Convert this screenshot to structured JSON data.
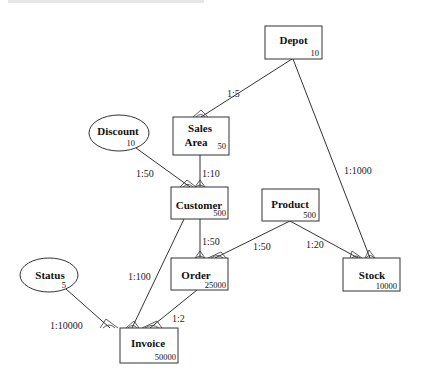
{
  "diagram": {
    "type": "entity-relationship",
    "entities": [
      {
        "id": "depot",
        "name": "Depot",
        "count": "10",
        "shape": "rect",
        "x": 265,
        "y": 26,
        "w": 57,
        "h": 33
      },
      {
        "id": "sales_area",
        "name_lines": [
          "Sales",
          "Area"
        ],
        "count": "50",
        "shape": "rect",
        "x": 173,
        "y": 117,
        "w": 56,
        "h": 38
      },
      {
        "id": "discount",
        "name": "Discount",
        "count": "10",
        "shape": "ellipse",
        "cx": 119,
        "cy": 133,
        "rx": 30,
        "ry": 18
      },
      {
        "id": "customer",
        "name": "Customer",
        "count": "500",
        "shape": "rect",
        "x": 171,
        "y": 187,
        "w": 57,
        "h": 32
      },
      {
        "id": "product",
        "name": "Product",
        "count": "500",
        "shape": "rect",
        "x": 262,
        "y": 189,
        "w": 57,
        "h": 32
      },
      {
        "id": "order",
        "name": "Order",
        "count": "25000",
        "shape": "rect",
        "x": 171,
        "y": 258,
        "w": 57,
        "h": 32
      },
      {
        "id": "stock",
        "name": "Stock",
        "count": "10000",
        "shape": "rect",
        "x": 343,
        "y": 258,
        "w": 57,
        "h": 33
      },
      {
        "id": "status",
        "name": "Status",
        "count": "5",
        "shape": "ellipse",
        "cx": 49,
        "cy": 275,
        "rx": 29,
        "ry": 17
      },
      {
        "id": "invoice",
        "name": "Invoice",
        "count": "50000",
        "shape": "rect",
        "x": 120,
        "y": 328,
        "w": 58,
        "h": 35
      }
    ],
    "relationships": [
      {
        "from": "depot",
        "to": "sales_area",
        "label": "1:5"
      },
      {
        "from": "depot",
        "to": "stock",
        "label": "1:1000"
      },
      {
        "from": "discount",
        "to": "customer",
        "label": "1:50"
      },
      {
        "from": "sales_area",
        "to": "customer",
        "label": "1:10"
      },
      {
        "from": "customer",
        "to": "order",
        "label": "1:50"
      },
      {
        "from": "product",
        "to": "order",
        "label": "1:50"
      },
      {
        "from": "product",
        "to": "stock",
        "label": "1:20"
      },
      {
        "from": "customer",
        "to": "invoice",
        "label": "1:100"
      },
      {
        "from": "status",
        "to": "invoice",
        "label": "1:10000"
      },
      {
        "from": "order",
        "to": "invoice",
        "label": "1:2"
      }
    ]
  },
  "labels": {
    "depot": {
      "name": "Depot",
      "count": "10"
    },
    "sales_area": {
      "name1": "Sales",
      "name2": "Area",
      "count": "50"
    },
    "discount": {
      "name": "Discount",
      "count": "10"
    },
    "customer": {
      "name": "Customer",
      "count": "500"
    },
    "product": {
      "name": "Product",
      "count": "500"
    },
    "order": {
      "name": "Order",
      "count": "25000"
    },
    "stock": {
      "name": "Stock",
      "count": "10000"
    },
    "status": {
      "name": "Status",
      "count": "5"
    },
    "invoice": {
      "name": "Invoice",
      "count": "50000"
    },
    "edges": {
      "depot_sales": "1:5",
      "depot_stock": "1:1000",
      "discount_customer": "1:50",
      "sales_customer": "1:10",
      "customer_order": "1:50",
      "product_order": "1:50",
      "product_stock": "1:20",
      "customer_invoice": "1:100",
      "status_invoice": "1:10000",
      "order_invoice": "1:2"
    }
  }
}
